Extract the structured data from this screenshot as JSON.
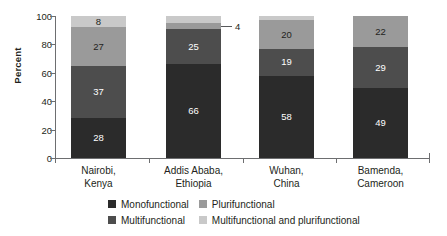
{
  "chart_data": {
    "type": "bar",
    "variant": "stacked-column-100",
    "title": "",
    "xlabel": "",
    "ylabel": "Percent",
    "ylim": [
      0,
      100
    ],
    "yticks": [
      0,
      20,
      40,
      60,
      80,
      100
    ],
    "ytick_labels": [
      "0",
      "20",
      "40",
      "60",
      "80",
      "100"
    ],
    "grid": false,
    "legend_position": "bottom",
    "categories": [
      "Nairobi,\nKenya",
      "Addis Ababa,\nEthiopia",
      "Wuhan,\nChina",
      "Bamenda,\nCameroon"
    ],
    "category_lines": [
      [
        "Nairobi,",
        "Kenya"
      ],
      [
        "Addis Ababa,",
        "Ethiopia"
      ],
      [
        "Wuhan,",
        "China"
      ],
      [
        "Bamenda,",
        "Cameroon"
      ]
    ],
    "series": [
      {
        "name": "Monofunctional",
        "color": "#2b2b2b",
        "values": [
          28,
          66,
          58,
          49
        ]
      },
      {
        "name": "Multifunctional",
        "color": "#4d4d4d",
        "values": [
          37,
          25,
          19,
          29
        ]
      },
      {
        "name": "Plurifunctional",
        "color": "#9a9a9a",
        "values": [
          27,
          4,
          20,
          22
        ]
      },
      {
        "name": "Multifunctional and plurifunctional",
        "color": "#c9c9c9",
        "values": [
          8,
          5,
          3,
          0
        ]
      }
    ],
    "annotations": [
      {
        "text": "4",
        "series": "Plurifunctional",
        "category": "Addis Ababa, Ethiopia",
        "style": "leader-line"
      }
    ]
  },
  "axis": {
    "y_title": "Percent"
  },
  "legend": {
    "items": [
      {
        "label": "Monofunctional",
        "color": "#2b2b2b"
      },
      {
        "label": "Plurifunctional",
        "color": "#9a9a9a"
      },
      {
        "label": "Multifunctional",
        "color": "#4d4d4d"
      },
      {
        "label": "Multifunctional and plurifunctional",
        "color": "#c9c9c9"
      }
    ]
  }
}
